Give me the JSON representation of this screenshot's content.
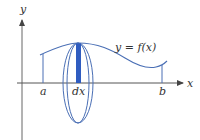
{
  "figure": {
    "type": "solid-of-revolution-disk-method",
    "labels": {
      "y_axis": "y",
      "x_axis": "x",
      "curve": "y = f(x)",
      "lower_bound": "a",
      "upper_bound": "b",
      "strip_width": "dx"
    },
    "colors": {
      "axes": "#555555",
      "curve": "#4a6fb5",
      "ellipse": "#4a6fb5",
      "strip_fill": "#2f5cc0",
      "bound_lines": "#4a6fb5",
      "text": "#333333"
    },
    "geometry": {
      "origin": [
        22,
        83
      ],
      "curve_points": [
        [
          40,
          55
        ],
        [
          60,
          46
        ],
        [
          78,
          43
        ],
        [
          100,
          45
        ],
        [
          120,
          55
        ],
        [
          140,
          66
        ],
        [
          150,
          68
        ],
        [
          160,
          66
        ],
        [
          167,
          61
        ]
      ],
      "a_x": 43,
      "b_x": 162,
      "strip": {
        "x": 76,
        "width": 5,
        "top": 43,
        "bottom": 83
      },
      "disk": {
        "cx": 78,
        "cy": 83,
        "ry": 40,
        "rx_outer": 15,
        "rx_inner": 11
      }
    }
  }
}
